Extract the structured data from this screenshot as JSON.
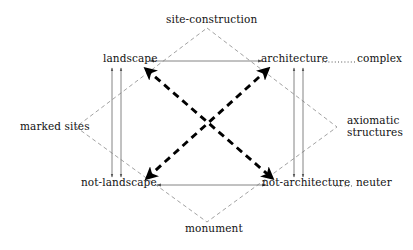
{
  "diagram": {
    "type": "greimas-square",
    "width": 413,
    "height": 250,
    "background_color": "#ffffff",
    "text_color": "#111111",
    "thin_line_color": "#777777",
    "diamond_line_color": "#8a8a8a",
    "bold_arrow_color": "#000000",
    "dotted_leader_color": "#555555"
  },
  "terms": {
    "top_left": "landscape",
    "top_right": "architecture",
    "bottom_left": "not-landscape",
    "bottom_right": "not-architecture"
  },
  "vertices": {
    "top": "site-construction",
    "bottom": "monument",
    "left": "marked sites",
    "right_line1": "axiomatic",
    "right_line2": "structures"
  },
  "schema_labels": {
    "complex": "complex",
    "neuter": "neuter"
  },
  "relations": [
    {
      "name": "contrariety-top",
      "from": "landscape",
      "to": "architecture",
      "style": "thin-double-arrow"
    },
    {
      "name": "contrariety-bottom",
      "from": "not-landscape",
      "to": "not-architecture",
      "style": "thin-double-arrow"
    },
    {
      "name": "implication-left",
      "from": "not-landscape",
      "to": "landscape",
      "style": "thin-double-vertical-pair"
    },
    {
      "name": "implication-right",
      "from": "not-architecture",
      "to": "architecture",
      "style": "thin-double-vertical-pair"
    },
    {
      "name": "contradiction-a",
      "from": "landscape",
      "to": "not-architecture",
      "style": "bold-dashed-double-arrow"
    },
    {
      "name": "contradiction-b",
      "from": "architecture",
      "to": "not-landscape",
      "style": "bold-dashed-double-arrow"
    },
    {
      "name": "leader-complex",
      "from": "architecture",
      "to": "complex",
      "style": "dotted-leader"
    },
    {
      "name": "leader-neuter",
      "from": "not-architecture",
      "to": "neuter",
      "style": "dotted-leader"
    }
  ]
}
